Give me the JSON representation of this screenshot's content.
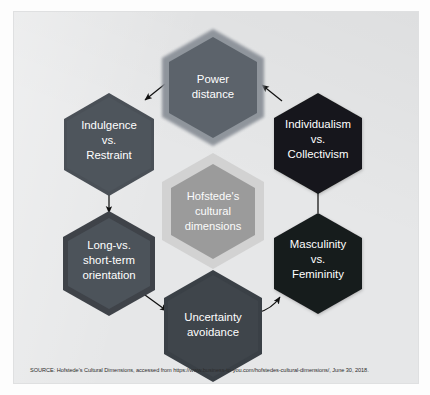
{
  "figure": {
    "title": "Hofstede's cultural dimensions",
    "panel_background": "#e6e7e8",
    "page_background": "#ffffff"
  },
  "center_node": {
    "id": "center",
    "lines": [
      "Hofstede's",
      "cultural",
      "dimensions"
    ],
    "fill": "#9b9b9b",
    "ring": "#cfcfcf",
    "text_color": "#ffffff"
  },
  "nodes": [
    {
      "id": "power-distance",
      "position": "top",
      "lines": [
        "Power",
        "distance"
      ],
      "fill": "#5c636b",
      "ring": "#8b9199",
      "text_color": "#ffffff"
    },
    {
      "id": "individualism-vs-collectivism",
      "position": "top-right",
      "lines": [
        "Individualism",
        "vs.",
        "Collectivism"
      ],
      "fill": "#16181a",
      "ring": "#16181a",
      "text_color": "#ffffff"
    },
    {
      "id": "masculinity-vs-femininity",
      "position": "bottom-right",
      "lines": [
        "Masculinity",
        "vs.",
        "Femininity"
      ],
      "fill": "#191b1d",
      "ring": "#191b1d",
      "text_color": "#ffffff"
    },
    {
      "id": "uncertainty-avoidance",
      "position": "bottom",
      "lines": [
        "Uncertainty",
        "avoidance"
      ],
      "fill": "#3f454b",
      "ring": "#3a4046",
      "text_color": "#ffffff"
    },
    {
      "id": "long-vs-short-term-orientation",
      "position": "bottom-left",
      "lines": [
        "Long-vs.",
        "short-term",
        "orientation"
      ],
      "fill": "#4c535a",
      "ring": "#3f4349",
      "text_color": "#ffffff"
    },
    {
      "id": "indulgence-vs-restraint",
      "position": "top-left",
      "lines": [
        "Indulgence",
        "vs.",
        "Restraint"
      ],
      "fill": "#4e555c",
      "ring": "#4a5057",
      "text_color": "#ffffff"
    }
  ],
  "arrows": [
    {
      "id": "arrow-power-distance-to-indulgence",
      "from": "power-distance",
      "to": "indulgence-vs-restraint",
      "direction": "down-left"
    },
    {
      "id": "arrow-indulgence-to-long-term",
      "from": "indulgence-vs-restraint",
      "to": "long-vs-short-term-orientation",
      "direction": "down"
    },
    {
      "id": "arrow-long-term-to-uncertainty",
      "from": "long-vs-short-term-orientation",
      "to": "uncertainty-avoidance",
      "direction": "down-right"
    },
    {
      "id": "arrow-uncertainty-to-masculinity",
      "from": "uncertainty-avoidance",
      "to": "masculinity-vs-femininity",
      "direction": "up-right"
    },
    {
      "id": "arrow-masculinity-to-individualism",
      "from": "masculinity-vs-femininity",
      "to": "individualism-vs-collectivism",
      "direction": "up"
    },
    {
      "id": "arrow-individualism-to-power-distance",
      "from": "individualism-vs-collectivism",
      "to": "power-distance",
      "direction": "up-left"
    }
  ],
  "source": {
    "text": "SOURCE: Hofstede's Cultural Dimensions, accessed from https://www.business-to-you.com/hofstedes-cultural-dimensions/, June 30, 2018."
  }
}
